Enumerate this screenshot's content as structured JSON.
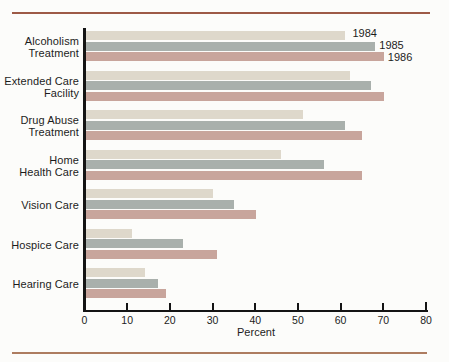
{
  "chart_data": {
    "type": "bar",
    "orientation": "horizontal",
    "title": "",
    "xlabel": "Percent",
    "xlim": [
      0,
      80
    ],
    "xticks": [
      0,
      10,
      20,
      30,
      40,
      50,
      60,
      70,
      80
    ],
    "grid": false,
    "legend_position": "inline labels right of first category's bars",
    "categories": [
      "Alcoholism Treatment",
      "Extended Care Facility",
      "Drug Abuse Treatment",
      "Home Health Care",
      "Vision Care",
      "Hospice Care",
      "Hearing Care"
    ],
    "category_label_lines": [
      [
        "Alcoholism",
        "Treatment"
      ],
      [
        "Extended Care",
        "Facility"
      ],
      [
        "Drug Abuse",
        "Treatment"
      ],
      [
        "Home",
        "Health Care"
      ],
      [
        "Vision Care"
      ],
      [
        "Hospice Care"
      ],
      [
        "Hearing Care"
      ]
    ],
    "series": [
      {
        "name": "1984",
        "color": "#ded8cb",
        "values": [
          61,
          62,
          51,
          46,
          30,
          11,
          14
        ]
      },
      {
        "name": "1985",
        "color": "#a9b0ac",
        "values": [
          68,
          67,
          61,
          56,
          35,
          23,
          17
        ]
      },
      {
        "name": "1986",
        "color": "#c8a59c",
        "values": [
          70,
          70,
          65,
          65,
          40,
          31,
          19
        ]
      }
    ]
  },
  "style": {
    "rule_color_top": "#9d5a46",
    "rule_color_bottom": "#ad7c60",
    "axis_color": "#141414",
    "text_color": "#1c1c1c",
    "background": "#fcfcfa"
  }
}
